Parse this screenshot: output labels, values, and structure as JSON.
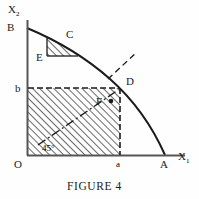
{
  "figure": {
    "caption": "FIGURE 4",
    "axes": {
      "x_label": "X",
      "x_label_sub": "1",
      "y_label": "X",
      "y_label_sub": "2",
      "origin_label": "O",
      "x_tick_label": "a",
      "y_tick_label": "b",
      "axis_color": "#555555"
    },
    "points": [
      {
        "name": "B",
        "label": "B",
        "x": 27,
        "y": 28
      },
      {
        "name": "C",
        "label": "C",
        "x": 70,
        "y": 42
      },
      {
        "name": "E",
        "label": "E",
        "x": 47,
        "y": 56
      },
      {
        "name": "D",
        "label": "D",
        "x": 120,
        "y": 88
      },
      {
        "name": "F",
        "label": "F",
        "x": 103,
        "y": 101
      },
      {
        "name": "A",
        "label": "A",
        "x": 165,
        "y": 155
      }
    ],
    "angle_annotation": {
      "label": "45°",
      "value": 45,
      "unit": "degrees"
    },
    "curve": {
      "type": "concave-arc",
      "from": "B",
      "through": "D",
      "to": "A",
      "color": "#1b1b1b"
    },
    "shaded_regions": [
      {
        "name": "rectangle-ODab",
        "hatch": "45-degree",
        "corners": [
          "O",
          "a",
          "D",
          "b"
        ]
      },
      {
        "name": "triangle-ECB",
        "hatch": "45-degree",
        "corners": [
          "E",
          "C",
          "curve"
        ]
      }
    ],
    "dashed_lines": [
      {
        "name": "b-to-D-horizontal"
      },
      {
        "name": "D-to-a-vertical"
      },
      {
        "name": "diagonal-45-ray"
      },
      {
        "name": "tangent-segment-at-D"
      }
    ],
    "colors": {
      "ink": "#1b1b1b",
      "hatch": "#3a3a3a",
      "axis": "#555555",
      "background": "#fefefe"
    }
  }
}
